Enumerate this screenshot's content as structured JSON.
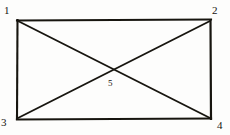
{
  "figure": {
    "kind": "geometry-diagram",
    "stroke_color": "#17150f",
    "background_color": "#fdfdfc",
    "vertices": [
      {
        "id": "1",
        "label": "1",
        "role": "top-left-corner",
        "x": 17,
        "y": 20
      },
      {
        "id": "2",
        "label": "2",
        "role": "top-right-corner",
        "x": 211,
        "y": 20
      },
      {
        "id": "3",
        "label": "3",
        "role": "bottom-left-corner",
        "x": 17,
        "y": 119
      },
      {
        "id": "4",
        "label": "4",
        "role": "bottom-right-corner",
        "x": 211,
        "y": 119
      },
      {
        "id": "5",
        "label": "5",
        "role": "diagonal-intersection",
        "x": 114,
        "y": 69
      }
    ],
    "edges": [
      {
        "id": "top",
        "from": "1",
        "to": "2"
      },
      {
        "id": "right",
        "from": "2",
        "to": "4"
      },
      {
        "id": "bottom",
        "from": "3",
        "to": "4"
      },
      {
        "id": "left",
        "from": "1",
        "to": "3"
      },
      {
        "id": "diagonal-1-4",
        "from": "1",
        "to": "4"
      },
      {
        "id": "diagonal-2-3",
        "from": "2",
        "to": "3"
      }
    ]
  }
}
